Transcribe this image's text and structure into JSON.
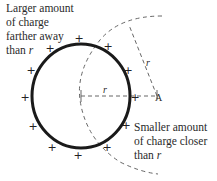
{
  "diagram": {
    "labels": {
      "far_line1": "Larger amount",
      "far_line2": "of charge",
      "far_line3": "farther away",
      "far_line4": "than ",
      "far_var": "r",
      "near_line1": "Smaller amount",
      "near_line2": "of charge closer",
      "near_line3": "than ",
      "near_var": "r",
      "radius_horizontal": "r",
      "radius_slanted": "r",
      "point": "A"
    },
    "charge_symbol": "+",
    "colors": {
      "ring": "#1a1a1a",
      "dashed": "#555555",
      "text": "#2a2a2a"
    }
  }
}
